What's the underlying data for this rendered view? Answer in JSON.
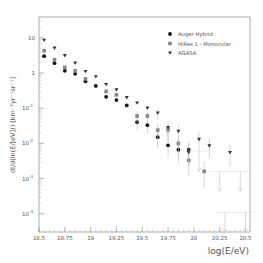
{
  "chart_data": {
    "type": "scatter",
    "title": "",
    "xlabel": "log(E/eV)",
    "ylabel": "dI/d(ln(E/[eV])) [km^-2 yr^-1 sr^-1]",
    "xlim": [
      18.5,
      20.55
    ],
    "ylim_log10": [
      -4.5,
      1.5
    ],
    "yscale": "log",
    "grid": false,
    "legend_position": "upper right",
    "x_ticks": [
      "18.5",
      "18.75",
      "19",
      "19.25",
      "19.5",
      "19.75",
      "20",
      "20.25",
      "20.5"
    ],
    "x_tick_values": [
      18.5,
      18.75,
      19,
      19.25,
      19.5,
      19.75,
      20,
      20.25,
      20.5
    ],
    "y_ticks": [
      "10",
      "1",
      "10^-1",
      "10^-2",
      "10^-3",
      "10^-4"
    ],
    "y_tick_values": [
      10,
      1,
      0.1,
      0.01,
      0.001,
      0.0001
    ],
    "series": [
      {
        "name": "Auger Hybrid",
        "marker": "circle",
        "color": "#111111",
        "x": [
          18.55,
          18.65,
          18.75,
          18.85,
          18.95,
          19.05,
          19.15,
          19.25,
          19.35,
          19.45,
          19.55,
          19.65,
          19.75,
          19.85,
          19.95
        ],
        "y": [
          3.0,
          1.9,
          1.15,
          0.95,
          0.58,
          0.43,
          0.21,
          0.17,
          0.12,
          0.04,
          0.033,
          0.015,
          0.0088,
          0.0066,
          0.0066
        ]
      },
      {
        "name": "HiRes 1 - Monocular",
        "marker": "square",
        "color": "#888888",
        "x": [
          18.55,
          18.65,
          18.75,
          18.85,
          18.95,
          19.15,
          19.25,
          19.45,
          19.55,
          19.65,
          19.75,
          19.85,
          19.95,
          20.1
        ],
        "y": [
          4.3,
          2.4,
          1.45,
          1.15,
          0.68,
          0.3,
          0.24,
          0.06,
          0.06,
          0.024,
          0.024,
          0.01,
          0.0033,
          0.0016
        ]
      },
      {
        "name": "AGASA",
        "marker": "triangle-down",
        "color": "#333333",
        "x": [
          18.55,
          18.65,
          18.75,
          18.85,
          18.95,
          19.05,
          19.15,
          19.25,
          19.35,
          19.45,
          19.55,
          19.65,
          19.75,
          19.85,
          19.95,
          20.05,
          20.15,
          20.35
        ],
        "y": [
          8.5,
          5.1,
          3.1,
          1.9,
          1.1,
          0.78,
          0.47,
          0.33,
          0.2,
          0.14,
          0.1,
          0.073,
          0.028,
          0.022,
          0.0055,
          0.013,
          0.0085,
          0.0055
        ]
      }
    ],
    "upper_limits": [
      {
        "x": 20.05,
        "y": 0.006
      },
      {
        "x": 20.25,
        "y": 0.0016
      },
      {
        "x": 20.45,
        "y": 0.0016
      },
      {
        "x": 20.3,
        "y": 0.00011
      },
      {
        "x": 20.5,
        "y": 0.00011
      }
    ]
  },
  "legend": {
    "items": [
      {
        "label": "Auger Hybrid",
        "marker": "circle"
      },
      {
        "label": "HiRes 1 - Monocular",
        "marker": "square"
      },
      {
        "label": "AGASA",
        "marker": "triangle-down"
      }
    ]
  },
  "axes": {
    "xlabel": "log(E/eV)",
    "ylabel": "dI/d(ln(E/[eV])) [km⁻²yr⁻¹sr⁻¹]"
  }
}
